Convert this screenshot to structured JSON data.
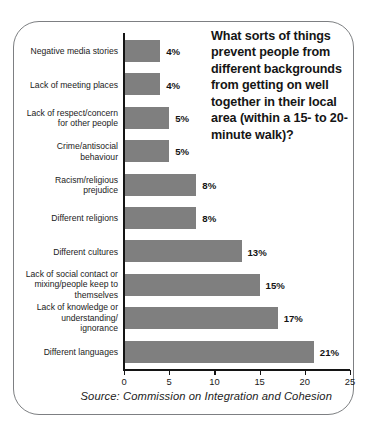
{
  "title": "What sorts of things prevent people from different backgrounds from getting on well together in their local area (within a 15- to 20-minute walk)?",
  "source": "Source: Commission on Integration and Cohesion",
  "colors": {
    "bar": "#7f7f7f",
    "axis": "#141414",
    "border": "#7d7f82",
    "background": "#ffffff",
    "text": "#1b1b1b"
  },
  "chart_data": {
    "type": "bar",
    "orientation": "horizontal",
    "title": "What sorts of things prevent people from different backgrounds from getting on well together in their local area (within a 15- to 20-minute walk)?",
    "xlabel": "",
    "ylabel": "",
    "xlim": [
      0,
      25
    ],
    "xticks": [
      0,
      5,
      10,
      15,
      20,
      25
    ],
    "xtick_labels": [
      "0",
      "5",
      "10",
      "15",
      "20",
      "25"
    ],
    "grid": false,
    "legend": null,
    "source": "Source: Commission on Integration and Cohesion",
    "categories": [
      "Negative media stories",
      "Lack of meeting places",
      "Lack of respect/concern for other people",
      "Crime/antisocial behaviour",
      "Racism/religious prejudice",
      "Different religions",
      "Different cultures",
      "Lack of social contact or mixing/people keep to themselves",
      "Lack of knowledge or understanding/ignorance",
      "Different languages"
    ],
    "category_lines": [
      [
        "Negative media stories"
      ],
      [
        "Lack of meeting places"
      ],
      [
        "Lack of respect/concern",
        "for other people"
      ],
      [
        "Crime/antisocial",
        "behaviour"
      ],
      [
        "Racism/religious",
        "prejudice"
      ],
      [
        "Different religions"
      ],
      [
        "Different cultures"
      ],
      [
        "Lack of social contact or",
        "mixing/people keep to",
        "themselves"
      ],
      [
        "Lack of knowledge or",
        "understanding/",
        "ignorance"
      ],
      [
        "Different languages"
      ]
    ],
    "values": [
      4,
      4,
      5,
      5,
      8,
      8,
      13,
      15,
      17,
      21
    ],
    "data_labels": [
      "4%",
      "4%",
      "5%",
      "5%",
      "8%",
      "8%",
      "13%",
      "15%",
      "17%",
      "21%"
    ]
  }
}
